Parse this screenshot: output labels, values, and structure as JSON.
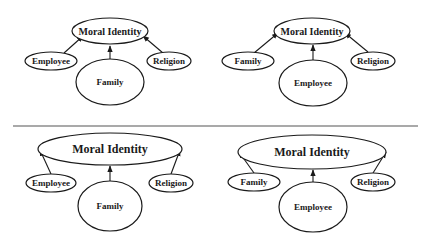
{
  "colors": {
    "stroke": "#1a1a1a",
    "divider": "#555555",
    "background": "#ffffff"
  },
  "panels": {
    "top_left": {
      "target": {
        "label": "Moral Identity"
      },
      "left": {
        "label": "Employee"
      },
      "center": {
        "label": "Family"
      },
      "right": {
        "label": "Religion"
      }
    },
    "top_right": {
      "target": {
        "label": "Moral Identity"
      },
      "left": {
        "label": "Family"
      },
      "center": {
        "label": "Employee"
      },
      "right": {
        "label": "Religion"
      }
    },
    "bottom_left": {
      "target": {
        "label": "Moral Identity"
      },
      "left": {
        "label": "Employee"
      },
      "center": {
        "label": "Family"
      },
      "right": {
        "label": "Religion"
      }
    },
    "bottom_right": {
      "target": {
        "label": "Moral Identity"
      },
      "left": {
        "label": "Family"
      },
      "center": {
        "label": "Employee"
      },
      "right": {
        "label": "Religion"
      }
    }
  }
}
